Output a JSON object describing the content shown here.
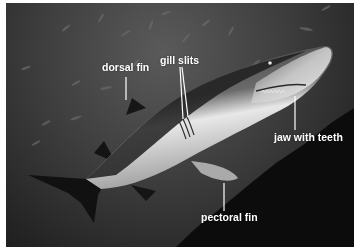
{
  "diagram": {
    "labels": [
      {
        "id": "dorsal-fin",
        "text": "dorsal fin"
      },
      {
        "id": "gill-slits",
        "text": "gill slits"
      },
      {
        "id": "jaw-with-teeth",
        "text": "jaw with teeth"
      },
      {
        "id": "pectoral-fin",
        "text": "pectoral fin"
      }
    ]
  },
  "colors": {
    "label_text": "#ffffff",
    "leader_line": "#ffffff",
    "frame_border": "#ffffff",
    "water_light": "#5a5a5a",
    "water_dark": "#1a1a1a"
  }
}
